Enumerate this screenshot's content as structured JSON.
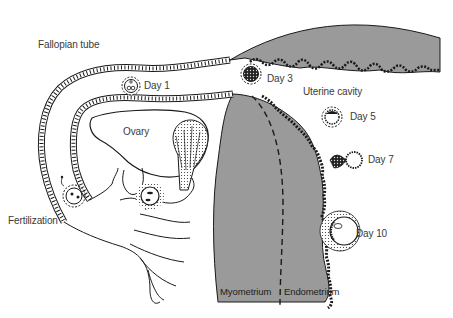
{
  "diagram": {
    "type": "anatomical-illustration",
    "colors": {
      "uterine_wall": "#9a9a9a",
      "outline": "#1a1a1a",
      "label_text": "#3a3a3a",
      "background": "#ffffff"
    },
    "labels": {
      "fallopian_tube": "Fallopian tube",
      "ovary": "Ovary",
      "fertilization": "Fertilization",
      "uterine_cavity": "Uterine cavity",
      "myometrium": "Myometrium",
      "endometrium": "Endometrium"
    },
    "stages": [
      {
        "id": "day1",
        "label": "Day 1"
      },
      {
        "id": "day3",
        "label": "Day 3"
      },
      {
        "id": "day5",
        "label": "Day 5"
      },
      {
        "id": "day7",
        "label": "Day 7"
      },
      {
        "id": "day10",
        "label": "Day 10"
      }
    ]
  }
}
